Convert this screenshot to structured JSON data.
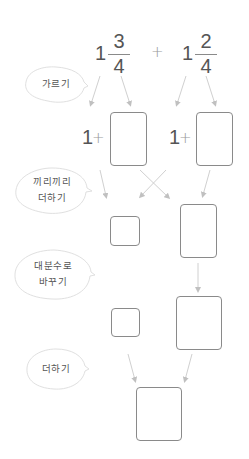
{
  "problem": {
    "term1": {
      "whole": "1",
      "numerator": "3",
      "denominator": "4"
    },
    "operator": "+",
    "term2": {
      "whole": "1",
      "numerator": "2",
      "denominator": "4"
    }
  },
  "steps": [
    {
      "label_lines": [
        "가르기"
      ]
    },
    {
      "label_lines": [
        "끼리끼리",
        "더하기"
      ]
    },
    {
      "label_lines": [
        "대분수로",
        "바꾸기"
      ]
    },
    {
      "label_lines": [
        "더하기"
      ]
    }
  ],
  "split_row": {
    "left": {
      "whole": "1",
      "operator": "+"
    },
    "right": {
      "whole": "1",
      "operator": "+"
    }
  },
  "colors": {
    "text": "#555555",
    "box_border": "#8a8a8a",
    "arrow": "#c8c8c8",
    "bubble_border": "#e0e0e0"
  }
}
